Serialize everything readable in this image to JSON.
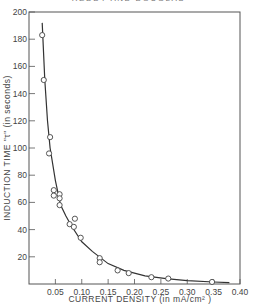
{
  "header": "REDDY AND DOUGLAS",
  "chart_data": {
    "type": "scatter",
    "title": "",
    "xlabel": "CURRENT DENSITY (in mA/cm² )",
    "ylabel": "INDUCTION  TIME \"τ\" (in seconds)",
    "xlim": [
      0,
      0.4
    ],
    "ylim": [
      0,
      200
    ],
    "x_ticks": [
      "0.05",
      "0.10",
      "0.15",
      "0.20",
      "0.25",
      "0.30",
      "0.35",
      "0.40"
    ],
    "y_ticks": [
      "20",
      "40",
      "60",
      "80",
      "100",
      "120",
      "140",
      "160",
      "180",
      "200"
    ],
    "grid": false,
    "legend": null,
    "series": [
      {
        "name": "measured",
        "marker": "open-circle",
        "x": [
          0.025,
          0.028,
          0.038,
          0.04,
          0.047,
          0.047,
          0.058,
          0.058,
          0.058,
          0.077,
          0.085,
          0.087,
          0.098,
          0.134,
          0.134,
          0.168,
          0.189,
          0.232,
          0.264,
          0.347
        ],
        "y": [
          183,
          150,
          96,
          108,
          69,
          65,
          66,
          63,
          58,
          44,
          42,
          48,
          34,
          19,
          16,
          10,
          8,
          5,
          4,
          1.5
        ]
      },
      {
        "name": "fitted curve",
        "marker": "line",
        "x": [
          0.025,
          0.03,
          0.035,
          0.04,
          0.05,
          0.06,
          0.07,
          0.08,
          0.1,
          0.12,
          0.15,
          0.18,
          0.22,
          0.26,
          0.3,
          0.35,
          0.38
        ],
        "y": [
          192,
          150,
          120,
          100,
          76,
          58,
          50,
          43,
          31,
          24,
          15,
          10,
          6,
          4,
          2.5,
          1.5,
          1
        ]
      }
    ]
  }
}
